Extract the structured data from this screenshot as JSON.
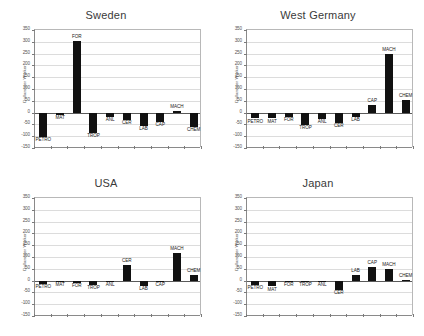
{
  "figure": {
    "categories": [
      "PETRO",
      "MAT",
      "FOR",
      "TROP",
      "ANL",
      "CER",
      "LAB",
      "CAP",
      "MACH",
      "CHEM"
    ],
    "ylabel": "Dollars per Worker",
    "ylim": [
      -150,
      350
    ],
    "yticks": [
      350,
      300,
      250,
      200,
      150,
      100,
      50,
      0,
      -50,
      -100,
      -150
    ],
    "ytick_labels": [
      "350",
      "300",
      "250",
      "200",
      "150",
      "100",
      "50",
      "0",
      "-50",
      "-100",
      "-150"
    ],
    "bar_color": "#111111"
  },
  "chart_data": [
    {
      "type": "bar",
      "title": "Sweden",
      "xlabel": "",
      "ylabel": "Dollars per Worker",
      "ylim": [
        -150,
        350
      ],
      "grid": true,
      "legend": "none",
      "categories": [
        "PETRO",
        "MAT",
        "FOR",
        "TROP",
        "ANL",
        "CER",
        "LAB",
        "CAP",
        "MACH",
        "CHEM"
      ],
      "values": [
        -105,
        -10,
        305,
        -88,
        -18,
        -30,
        -55,
        -40,
        5,
        -62
      ]
    },
    {
      "type": "bar",
      "title": "West Germany",
      "xlabel": "",
      "ylabel": "Dollars per Worker",
      "ylim": [
        -150,
        350
      ],
      "grid": true,
      "legend": "none",
      "categories": [
        "PETRO",
        "MAT",
        "FOR",
        "TROP",
        "ANL",
        "CER",
        "LAB",
        "CAP",
        "MACH",
        "CHEM"
      ],
      "values": [
        -25,
        -25,
        -20,
        -52,
        -28,
        -42,
        -18,
        32,
        250,
        52
      ]
    },
    {
      "type": "bar",
      "title": "USA",
      "xlabel": "",
      "ylabel": "Dollars per Worker",
      "ylim": [
        -150,
        350
      ],
      "grid": true,
      "legend": "none",
      "categories": [
        "PETRO",
        "MAT",
        "FOR",
        "TROP",
        "ANL",
        "CER",
        "LAB",
        "CAP",
        "MACH",
        "CHEM"
      ],
      "values": [
        -15,
        -6,
        -10,
        -20,
        -8,
        67,
        -22,
        -6,
        118,
        22
      ]
    },
    {
      "type": "bar",
      "title": "Japan",
      "xlabel": "",
      "ylabel": "Dollars per Worker",
      "ylim": [
        -150,
        350
      ],
      "grid": true,
      "legend": "none",
      "categories": [
        "PETRO",
        "MAT",
        "FOR",
        "TROP",
        "ANL",
        "CER",
        "LAB",
        "CAP",
        "MACH",
        "CHEM"
      ],
      "values": [
        -18,
        -25,
        -5,
        -5,
        -3,
        -38,
        22,
        58,
        48,
        3
      ]
    }
  ]
}
